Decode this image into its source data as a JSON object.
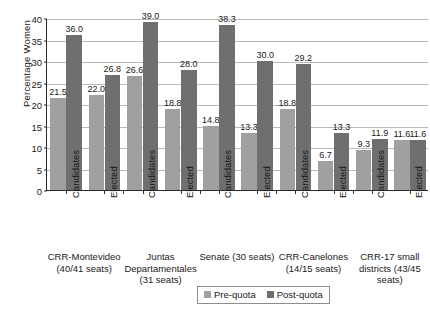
{
  "chart_data": {
    "type": "bar",
    "title": "",
    "xlabel": "",
    "ylabel": "Percentage Women",
    "ylim": [
      0,
      40
    ],
    "yticks": [
      0,
      5,
      10,
      15,
      20,
      25,
      30,
      35,
      40
    ],
    "grid": "horizontal",
    "legend_position": "bottom-center",
    "categories": [
      "CRR-Montevideo (40/41 seats) — Candidates",
      "CRR-Montevideo (40/41 seats) — Elected",
      "Juntas Departamentales (31 seats) — Candidates",
      "Juntas Departamentales (31 seats) — Elected",
      "Senate (30 seats) — Candidates",
      "Senate (30 seats) — Elected",
      "CRR-Canelones (14/15 seats) — Candidates",
      "CRR-Canelones (14/15 seats) — Elected",
      "CRR-17 small districts (43/45 seats) — Candidates",
      "CRR-17 small districts (43/45 seats) — Elected"
    ],
    "series": [
      {
        "name": "Pre-quota",
        "color": "#a0a0a0",
        "values": [
          21.5,
          22.0,
          26.6,
          18.8,
          14.8,
          13.3,
          18.8,
          6.7,
          9.3,
          11.6
        ]
      },
      {
        "name": "Post-quota",
        "color": "#6f6f6f",
        "values": [
          36.0,
          26.8,
          39.0,
          28.0,
          38.3,
          30.0,
          29.2,
          13.3,
          11.9,
          11.6
        ]
      }
    ],
    "data_labels": [
      {
        "series": "Pre-quota",
        "text": "21.5"
      },
      {
        "series": "Post-quota",
        "text": "36.0"
      },
      {
        "series": "Pre-quota",
        "text": "22.0"
      },
      {
        "series": "Post-quota",
        "text": "26.8"
      },
      {
        "series": "Pre-quota",
        "text": "26.6"
      },
      {
        "series": "Post-quota",
        "text": "39.0"
      },
      {
        "series": "Pre-quota",
        "text": "18.8"
      },
      {
        "series": "Post-quota",
        "text": "28.0"
      },
      {
        "series": "Pre-quota",
        "text": "14.8"
      },
      {
        "series": "Post-quota",
        "text": "38.3"
      },
      {
        "series": "Pre-quota",
        "text": "13.3"
      },
      {
        "series": "Post-quota",
        "text": "30.0"
      },
      {
        "series": "Pre-quota",
        "text": "18.8"
      },
      {
        "series": "Post-quota",
        "text": "29.2"
      },
      {
        "series": "Pre-quota",
        "text": "6.7"
      },
      {
        "series": "Post-quota",
        "text": "13.3"
      },
      {
        "series": "Pre-quota",
        "text": "9.3"
      },
      {
        "series": "Post-quota",
        "text": "11.9"
      },
      {
        "series": "Pre-quota",
        "text": "11.6"
      },
      {
        "series": "Post-quota",
        "text": "11.6"
      }
    ],
    "tick_labels": [
      "Candidates",
      "Elected",
      "Candidates",
      "Elected",
      "Candidates",
      "Elected",
      "Candidates",
      "Elected",
      "Candidates",
      "Elected"
    ],
    "groups": [
      {
        "lines": [
          "CRR-Montevideo",
          "(40/41 seats)"
        ]
      },
      {
        "lines": [
          "Juntas",
          "Departamentales",
          "(31 seats)"
        ]
      },
      {
        "lines": [
          "Senate (30 seats)"
        ]
      },
      {
        "lines": [
          "CRR-Canelones",
          "(14/15 seats)"
        ]
      },
      {
        "lines": [
          "CRR-17 small",
          "districts (43/45",
          "seats)"
        ]
      }
    ],
    "legend": [
      {
        "label": "Pre-quota",
        "color": "#a0a0a0"
      },
      {
        "label": "Post-quota",
        "color": "#6f6f6f"
      }
    ]
  }
}
